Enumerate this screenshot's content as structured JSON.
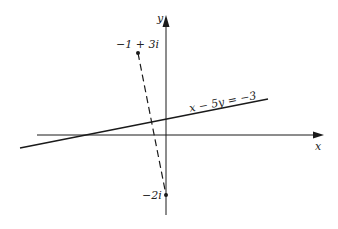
{
  "figure": {
    "axes": {
      "x_label": "x",
      "y_label": "y"
    },
    "points": [
      {
        "label": "−1 + 3i",
        "re": -1,
        "im": 3
      },
      {
        "label": "−2i",
        "re": 0,
        "im": -2
      }
    ],
    "line": {
      "equation": "x − 5y = −3"
    },
    "segment": {
      "style": "dashed",
      "from": "−1 + 3i",
      "to": "−2i"
    },
    "colors": {
      "ink": "#1a1a1a",
      "background": "#ffffff"
    }
  }
}
